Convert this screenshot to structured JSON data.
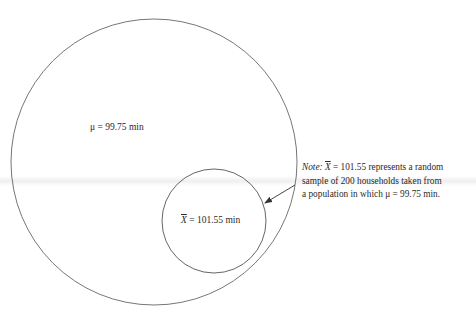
{
  "diagram": {
    "type": "population-sample",
    "population_circle": {
      "label_symbol": "μ",
      "label_text": "μ = 99.75 min",
      "value": 99.75,
      "unit": "min"
    },
    "sample_circle": {
      "label_symbol": "X",
      "label_eq": " = 101.55 min",
      "value": 101.55,
      "unit": "min"
    },
    "note": {
      "lead": "Note:",
      "line1_symbol": "X",
      "line1_rest": " = 101.55 represents a random",
      "line2": "sample of 200 households taken from",
      "line3": "a population in which μ = 99.75 min.",
      "sample_size": 200
    },
    "colors": {
      "stroke": "#555555",
      "text": "#2a2a2a",
      "background": "#ffffff"
    }
  }
}
